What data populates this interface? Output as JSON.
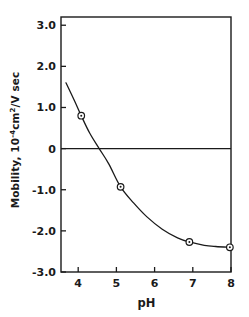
{
  "chart_data": {
    "type": "line",
    "title": "",
    "xlabel": "pH",
    "ylabel": "Mobility, 10-4cm2/V sec",
    "ylabel_parts": {
      "prefix": "Mobility, 10",
      "exp1": "-4",
      "mid": "cm",
      "exp2": "2",
      "suffix": "/V sec"
    },
    "xlim": [
      3.55,
      8.0
    ],
    "ylim": [
      -3.0,
      3.2
    ],
    "xticks": [
      "4",
      "5",
      "6",
      "7",
      "8"
    ],
    "xtick_values": [
      4,
      5,
      6,
      7,
      8
    ],
    "yticks": [
      "3.0",
      "2.0",
      "1.0",
      "0",
      "-1.0",
      "-2.0",
      "-3.0"
    ],
    "ytick_values": [
      3.0,
      2.0,
      1.0,
      0,
      -1.0,
      -2.0,
      -3.0
    ],
    "grid": false,
    "legend": "none",
    "zero_line": 0,
    "marker": "open-circle-with-dot",
    "series": [
      {
        "name": "mobility",
        "x": [
          4.08,
          5.11,
          6.91,
          7.97
        ],
        "values": [
          0.8,
          -0.93,
          -2.27,
          -2.4
        ]
      }
    ],
    "curve_points": [
      {
        "x": 3.68,
        "y": 1.6
      },
      {
        "x": 3.9,
        "y": 1.17
      },
      {
        "x": 4.08,
        "y": 0.8
      },
      {
        "x": 4.3,
        "y": 0.38
      },
      {
        "x": 4.55,
        "y": 0.0
      },
      {
        "x": 4.8,
        "y": -0.37
      },
      {
        "x": 5.11,
        "y": -0.93
      },
      {
        "x": 5.45,
        "y": -1.32
      },
      {
        "x": 5.8,
        "y": -1.66
      },
      {
        "x": 6.2,
        "y": -1.96
      },
      {
        "x": 6.6,
        "y": -2.17
      },
      {
        "x": 6.91,
        "y": -2.27
      },
      {
        "x": 7.3,
        "y": -2.35
      },
      {
        "x": 7.6,
        "y": -2.38
      },
      {
        "x": 7.97,
        "y": -2.4
      }
    ],
    "x_intercept": 4.55,
    "colors": {
      "axis": "#1a1a1a",
      "curve": "#1a1a1a",
      "marker_fill": "#ffffff",
      "marker_edge": "#1a1a1a",
      "background": "#ffffff"
    }
  }
}
